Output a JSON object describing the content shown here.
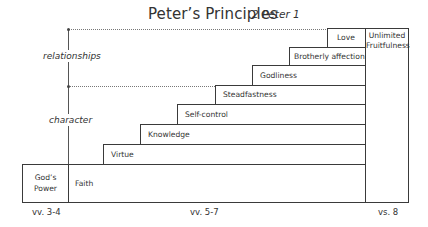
{
  "title": "Peter’s Principles",
  "subtitle": "2 Peter 1",
  "side_labels": {
    "upper": "relationships",
    "lower": "character"
  },
  "origin_box": {
    "line1": "God’s",
    "line2": "Power"
  },
  "steps": [
    {
      "label": "Faith"
    },
    {
      "label": "Virtue"
    },
    {
      "label": "Knowledge"
    },
    {
      "label": "Self-control"
    },
    {
      "label": "Steadfastness"
    },
    {
      "label": "Godliness"
    },
    {
      "label": "Brotherly affection"
    },
    {
      "label": "Love"
    }
  ],
  "result_box": {
    "line1": "Unlimited",
    "line2": "Fruitfulness"
  },
  "bottom_labels": {
    "left": "vv. 3-4",
    "middle": "vv. 5-7",
    "right": "vs. 8"
  },
  "colors": {
    "line": "#3a3a3a",
    "text": "#333333",
    "background": "#ffffff"
  }
}
